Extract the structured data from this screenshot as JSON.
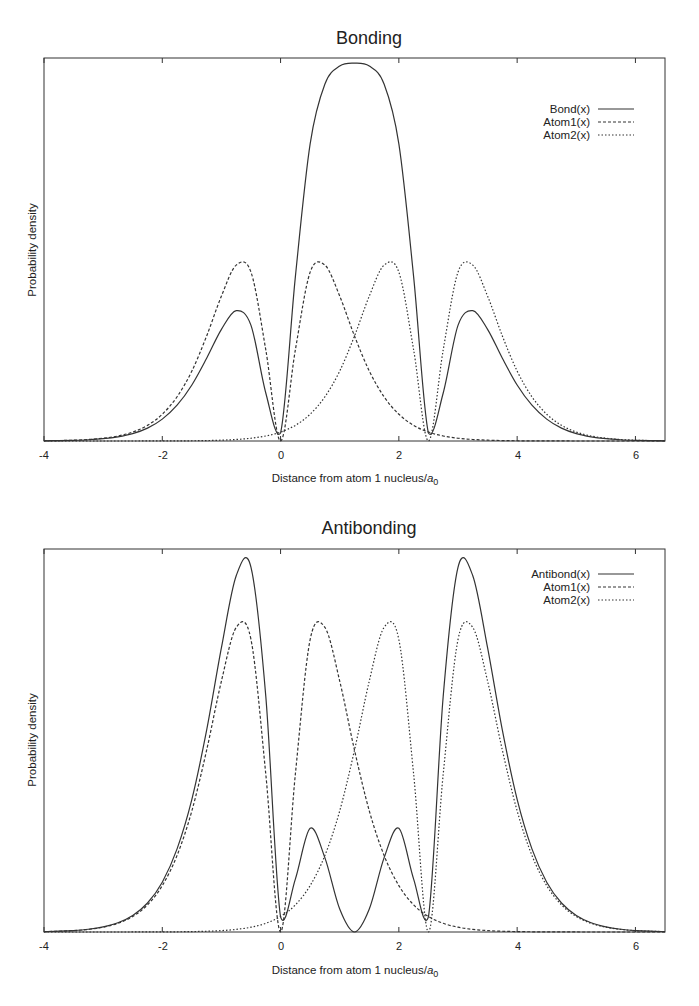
{
  "chart_data": [
    {
      "type": "line",
      "title": "Bonding",
      "xlabel": "Distance from atom 1 nucleus/a0",
      "xlabel_main": "Distance from atom 1 nucleus/",
      "xlabel_sym": "a",
      "xlabel_sub": "0",
      "ylabel": "Probability density",
      "xlim": [
        -4,
        6.5
      ],
      "ylim": [
        0,
        2.13
      ],
      "xticks": [
        -4,
        -2,
        0,
        2,
        4,
        6
      ],
      "yticks": [],
      "grid": false,
      "legend_position": "upper right",
      "x": [
        -4,
        -3.75,
        -3.5,
        -3.25,
        -3,
        -2.75,
        -2.5,
        -2.25,
        -2,
        -1.75,
        -1.5,
        -1.25,
        -1,
        -0.75,
        -0.5,
        -0.25,
        0,
        0.25,
        0.5,
        0.75,
        1,
        1.25,
        1.5,
        1.75,
        2,
        2.25,
        2.5,
        2.75,
        3,
        3.25,
        3.5,
        3.75,
        4,
        4.25,
        4.5,
        4.75,
        5,
        5.25,
        5.5,
        5.75,
        6,
        6.25,
        6.5
      ],
      "series": [
        {
          "name": "Bond(x)",
          "style": "solid",
          "values": [
            0.001,
            0.002,
            0.0038,
            0.007,
            0.0128,
            0.0231,
            0.041,
            0.0714,
            0.1216,
            0.199,
            0.3116,
            0.46,
            0.621,
            0.725,
            0.643,
            0.267,
            0.0448,
            0.913,
            1.652,
            1.985,
            2.085,
            2.101,
            2.085,
            1.985,
            1.652,
            0.913,
            0.0448,
            0.267,
            0.643,
            0.725,
            0.621,
            0.46,
            0.3116,
            0.199,
            0.1216,
            0.0714,
            0.041,
            0.0231,
            0.0128,
            0.007,
            0.0038,
            0.002,
            0.0011
          ]
        },
        {
          "name": "Atom1(x)",
          "style": "dashed",
          "values": [
            0.0013,
            0.0024,
            0.0045,
            0.0084,
            0.0154,
            0.0279,
            0.0497,
            0.087,
            0.149,
            0.246,
            0.389,
            0.584,
            0.806,
            0.978,
            0.939,
            0.507,
            0,
            0.507,
            0.939,
            0.978,
            0.806,
            0.584,
            0.389,
            0.246,
            0.149,
            0.087,
            0.0497,
            0.0279,
            0.0154,
            0.0084,
            0.0045,
            0.0024,
            0.0013,
            0.0007,
            0.0003,
            0.0002,
            0.0001,
            0,
            0,
            0,
            0,
            0,
            0
          ]
        },
        {
          "name": "Atom2(x)",
          "style": "dotted",
          "values": [
            0,
            0,
            0,
            0,
            0,
            0,
            0.0001,
            0.0002,
            0.0003,
            0.0007,
            0.0013,
            0.0024,
            0.0045,
            0.0084,
            0.0154,
            0.0279,
            0.0497,
            0.087,
            0.149,
            0.246,
            0.389,
            0.584,
            0.806,
            0.978,
            0.939,
            0.507,
            0,
            0.507,
            0.939,
            0.978,
            0.806,
            0.584,
            0.389,
            0.246,
            0.149,
            0.087,
            0.0497,
            0.0279,
            0.0154,
            0.0084,
            0.0045,
            0.0024,
            0.0013
          ]
        }
      ]
    },
    {
      "type": "line",
      "title": "Antibonding",
      "xlabel": "Distance from atom 1 nucleus/a0",
      "xlabel_main": "Distance from atom 1 nucleus/",
      "xlabel_sym": "a",
      "xlabel_sub": "0",
      "ylabel": "Probability density",
      "xlim": [
        -4,
        6.5
      ],
      "ylim": [
        0,
        1.23
      ],
      "xticks": [
        -4,
        -2,
        0,
        2,
        4,
        6
      ],
      "yticks": [],
      "grid": false,
      "legend_position": "upper right",
      "x": [
        -4,
        -3.75,
        -3.5,
        -3.25,
        -3,
        -2.75,
        -2.5,
        -2.25,
        -2,
        -1.75,
        -1.5,
        -1.25,
        -1,
        -0.75,
        -0.5,
        -0.25,
        0,
        0.25,
        0.5,
        0.75,
        1,
        1.25,
        1.5,
        1.75,
        2,
        2.25,
        2.5,
        2.75,
        3,
        3.25,
        3.5,
        3.75,
        4,
        4.25,
        4.5,
        4.75,
        5,
        5.25,
        5.5,
        5.75,
        6,
        6.25,
        6.5
      ],
      "series": [
        {
          "name": "Antibond(x)",
          "style": "solid",
          "values": [
            0.0013,
            0.0025,
            0.0047,
            0.0088,
            0.0163,
            0.0296,
            0.053,
            0.0931,
            0.16,
            0.267,
            0.426,
            0.648,
            0.913,
            1.144,
            1.171,
            0.757,
            0.0487,
            0.17,
            0.333,
            0.238,
            0.0736,
            0,
            0.0736,
            0.238,
            0.333,
            0.17,
            0.0487,
            0.757,
            1.171,
            1.144,
            0.913,
            0.648,
            0.426,
            0.267,
            0.16,
            0.0931,
            0.053,
            0.0296,
            0.0163,
            0.0088,
            0.0047,
            0.0025,
            0.0013
          ]
        },
        {
          "name": "Atom1(x)",
          "style": "dashed",
          "values": [
            0.0013,
            0.0024,
            0.0045,
            0.0084,
            0.0154,
            0.0279,
            0.0497,
            0.087,
            0.149,
            0.246,
            0.389,
            0.584,
            0.806,
            0.978,
            0.939,
            0.507,
            0,
            0.507,
            0.939,
            0.978,
            0.806,
            0.584,
            0.389,
            0.246,
            0.149,
            0.087,
            0.0497,
            0.0279,
            0.0154,
            0.0084,
            0.0045,
            0.0024,
            0.0013,
            0.0007,
            0.0003,
            0.0002,
            0.0001,
            0,
            0,
            0,
            0,
            0,
            0
          ]
        },
        {
          "name": "Atom2(x)",
          "style": "dotted",
          "values": [
            0,
            0,
            0,
            0,
            0,
            0,
            0.0001,
            0.0002,
            0.0003,
            0.0007,
            0.0013,
            0.0024,
            0.0045,
            0.0084,
            0.0154,
            0.0279,
            0.0497,
            0.087,
            0.149,
            0.246,
            0.389,
            0.584,
            0.806,
            0.978,
            0.939,
            0.507,
            0,
            0.507,
            0.939,
            0.978,
            0.806,
            0.584,
            0.389,
            0.246,
            0.149,
            0.087,
            0.0497,
            0.0279,
            0.0154,
            0.0084,
            0.0045,
            0.0024,
            0.0013
          ]
        }
      ]
    }
  ],
  "plots": [
    {
      "title": "Bonding",
      "ylabel": "Probability density",
      "xlabel_main": "Distance from atom 1 nucleus/",
      "xlabel_sym": "a",
      "xlabel_sub": "0",
      "tick_labels": [
        "-4",
        "-2",
        "0",
        "2",
        "4",
        "6"
      ],
      "legend": [
        "Bond(x)",
        "Atom1(x)",
        "Atom2(x)"
      ]
    },
    {
      "title": "Antibonding",
      "ylabel": "Probability density",
      "xlabel_main": "Distance from atom 1 nucleus/",
      "xlabel_sym": "a",
      "xlabel_sub": "0",
      "tick_labels": [
        "-4",
        "-2",
        "0",
        "2",
        "4",
        "6"
      ],
      "legend": [
        "Antibond(x)",
        "Atom1(x)",
        "Atom2(x)"
      ]
    }
  ],
  "colors": {
    "line": "#333333",
    "background": "#ffffff"
  }
}
